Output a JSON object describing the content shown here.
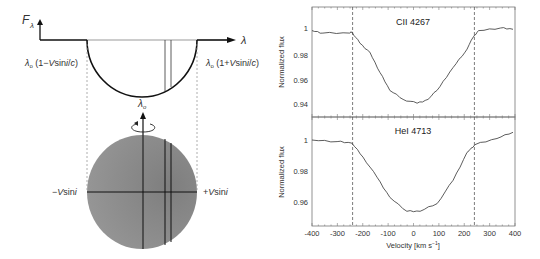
{
  "left_diagram": {
    "flux_axis_label": "F",
    "flux_axis_subscript": "λ",
    "wavelength_axis_label": "λ",
    "left_edge_label": "λo (1−Vsini/c)",
    "left_edge_prefix": "λ",
    "left_edge_sub": "o",
    "left_edge_text": " (1−",
    "left_edge_v": "V",
    "left_edge_sin": "sin",
    "left_edge_i": "i",
    "left_edge_slash": "/",
    "left_edge_c": "c",
    "left_edge_close": ")",
    "right_edge_label": "λo (1+Vsini/c)",
    "right_edge_text": " (1+",
    "center_label": "λ",
    "center_sub": "o",
    "minus_vsini_label": "−Vsini",
    "minus_sign": "−",
    "plus_sign": "+",
    "vsini_v": "V",
    "vsini_sin": "sin",
    "vsini_i": "i",
    "star_color": "#8f8f8f",
    "icons": [
      "up-arrow-icon",
      "rotation-arrow-icon",
      "right-arrow-icon"
    ]
  },
  "chart_data": [
    {
      "type": "line",
      "title": "CII 4267",
      "xlabel": "Velocity [km s⁻¹]",
      "ylabel": "Normalized flux",
      "xlim": [
        -400,
        400
      ],
      "ylim": [
        0.932,
        1.016
      ],
      "yticks": [
        0.94,
        0.96,
        0.98,
        1
      ],
      "ytick_labels": [
        "0.94",
        "0.96",
        "0.98",
        "1"
      ],
      "vlines_dashed": [
        -240,
        240
      ],
      "x": [
        -400,
        -357,
        -251,
        -243,
        -211,
        -172,
        -132,
        -93,
        -41,
        14,
        57,
        104,
        156,
        203,
        236,
        256,
        343,
        392
      ],
      "values": [
        0.998,
        0.996,
        0.996,
        0.997,
        0.988,
        0.981,
        0.965,
        0.951,
        0.944,
        0.941,
        0.944,
        0.954,
        0.969,
        0.981,
        0.993,
        0.998,
        1.0,
        0.999
      ]
    },
    {
      "type": "line",
      "title": "HeI 4713",
      "xlabel": "Velocity [km s⁻¹]",
      "ylabel": "Normalized flux",
      "xlim": [
        -400,
        400
      ],
      "ylim": [
        0.947,
        1.012
      ],
      "yticks": [
        0.96,
        0.98,
        1
      ],
      "ytick_labels": [
        "0.96",
        "0.98",
        "1"
      ],
      "xticks": [
        -400,
        -300,
        -200,
        -100,
        0,
        100,
        200,
        300,
        400
      ],
      "xtick_labels": [
        "-400",
        "-300",
        "-200",
        "-100",
        "0",
        "100",
        "200",
        "300",
        "400"
      ],
      "vlines_dashed": [
        -240,
        240
      ],
      "x": [
        -400,
        -301,
        -243,
        -199,
        -144,
        -93,
        -26,
        26,
        93,
        156,
        211,
        242,
        329,
        392
      ],
      "values": [
        1.0,
        0.999,
        0.998,
        0.989,
        0.976,
        0.963,
        0.954,
        0.954,
        0.959,
        0.974,
        0.992,
        0.997,
        1.001,
        1.005
      ]
    }
  ],
  "right_panel": {
    "top_title": "CII 4267",
    "bottom_title": "HeI 4713",
    "ylabel": "Normalized flux",
    "xlabel_prefix": "Velocity [km s",
    "xlabel_sup": "−1",
    "xlabel_suffix": "]",
    "top_yticks": [
      "1",
      "0.98",
      "0.96",
      "0.94"
    ],
    "bottom_yticks": [
      "1",
      "0.98",
      "0.96"
    ],
    "xticks": [
      "-400",
      "-300",
      "-200",
      "-100",
      "0",
      "100",
      "200",
      "300",
      "400"
    ]
  }
}
